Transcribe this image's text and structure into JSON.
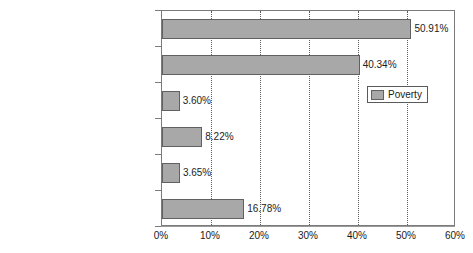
{
  "chart_data": {
    "type": "bar",
    "orientation": "horizontal",
    "title": "",
    "xlabel": "",
    "ylabel": "",
    "categories": [
      "Sub-Saharan Africa",
      "South Asia",
      "Middle East and North Africa",
      "Latin America and the Caribbean",
      "Eastern Europe and Central Asia",
      "East Asia and Pacific"
    ],
    "values": [
      50.91,
      40.34,
      3.6,
      8.22,
      3.65,
      16.78
    ],
    "value_labels": [
      "50.91%",
      "40.34%",
      "3.60%",
      "8.22%",
      "3.65%",
      "16.78%"
    ],
    "series": [
      {
        "name": "Poverty",
        "values": [
          50.91,
          40.34,
          3.6,
          8.22,
          3.65,
          16.78
        ],
        "color": "#a8a8a8"
      }
    ],
    "xlim": [
      0,
      60
    ],
    "xticks": [
      0,
      10,
      20,
      30,
      40,
      50,
      60
    ],
    "xtick_labels": [
      "0%",
      "10%",
      "20%",
      "30%",
      "40%",
      "50%",
      "60%"
    ],
    "grid": "vertical-dotted",
    "legend": {
      "position": "upper-right",
      "entries": [
        {
          "label": "Poverty",
          "color": "#a8a8a8"
        }
      ]
    }
  },
  "style": {
    "bar_fill": "#a8a8a8",
    "bar_border": "#616161",
    "grid_color": "#5a5a5a",
    "frame_color": "#7b7b7b",
    "text_color": "#1a1a1a",
    "background": "#ffffff"
  }
}
